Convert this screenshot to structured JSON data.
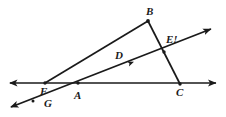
{
  "figure": {
    "background_color": "#ffffff",
    "stroke_color": "#1a1a1a",
    "label_color": "#1a1a1a",
    "width": 226,
    "height": 117
  },
  "labels": [
    {
      "id": "B",
      "text": "B",
      "x": 146,
      "y": 6,
      "anchor": "left"
    },
    {
      "id": "E",
      "text": "E!",
      "x": 166,
      "y": 34,
      "anchor": "left"
    },
    {
      "id": "D",
      "text": "D",
      "x": 115,
      "y": 50,
      "anchor": "left"
    },
    {
      "id": "F",
      "text": "F",
      "x": 40,
      "y": 86,
      "anchor": "left"
    },
    {
      "id": "A",
      "text": "A",
      "x": 74,
      "y": 90,
      "anchor": "left"
    },
    {
      "id": "C",
      "text": "C",
      "x": 176,
      "y": 87,
      "anchor": "left"
    },
    {
      "id": "G",
      "text": "G",
      "x": 44,
      "y": 98,
      "anchor": "left"
    }
  ],
  "points": [
    {
      "id": "F",
      "x": 45,
      "y": 83,
      "marked": true
    },
    {
      "id": "A",
      "x": 78,
      "y": 83,
      "marked": true
    },
    {
      "id": "C",
      "x": 180,
      "y": 84,
      "marked": true
    },
    {
      "id": "B",
      "x": 148,
      "y": 21,
      "marked": true
    },
    {
      "id": "E",
      "x": 164,
      "y": 52,
      "marked": true
    },
    {
      "id": "D",
      "x": 124,
      "y": 62,
      "marked": true
    },
    {
      "id": "G",
      "x": 33,
      "y": 101,
      "marked": true
    }
  ],
  "lines": [
    {
      "id": "horizontal-line",
      "name": "line-through-F-A-C",
      "x1": 10,
      "y1": 83,
      "x2": 216,
      "y2": 83,
      "arrow_start": true,
      "arrow_end": true,
      "width": 1.6
    },
    {
      "id": "transversal-line",
      "name": "line-through-G-A-D-E",
      "x1": 11,
      "y1": 107,
      "x2": 211,
      "y2": 29,
      "arrow_start": true,
      "arrow_end": true,
      "width": 1.6
    },
    {
      "id": "segment-FB",
      "name": "segment-F-to-B",
      "x1": 45,
      "y1": 83,
      "x2": 148,
      "y2": 21,
      "arrow_start": false,
      "arrow_end": false,
      "width": 1.6
    },
    {
      "id": "segment-BC",
      "name": "segment-B-to-C-through-E",
      "x1": 148,
      "y1": 21,
      "x2": 180,
      "y2": 84,
      "arrow_start": false,
      "arrow_end": false,
      "width": 1.6
    }
  ],
  "direction_marker": {
    "id": "tick-arrow-on-transversal",
    "name": "direction-arrowhead-near-D",
    "x": 128,
    "y": 64,
    "angle_deg": -21
  }
}
